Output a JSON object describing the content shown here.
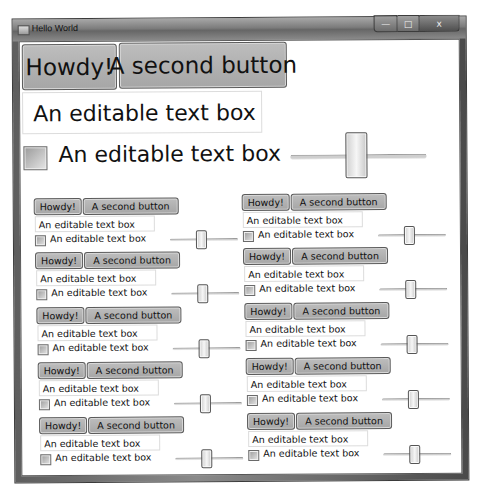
{
  "window": {
    "title": "Hello World",
    "caption_buttons": {
      "minimize": "—",
      "maximize": "□",
      "close": "x"
    }
  },
  "main_controls": {
    "button_1": "Howdy!",
    "button_2": "A second button",
    "text_box_value": "An editable text box",
    "checkbox_label": "An editable text box",
    "checkbox_checked": false,
    "slider_value_pct": 50
  },
  "grid": {
    "columns": 2,
    "rows": 5,
    "items": [
      {
        "button_1": "Howdy!",
        "button_2": "A second button",
        "text_box_value": "An editable text box",
        "checkbox_label": "An editable text box"
      },
      {
        "button_1": "Howdy!",
        "button_2": "A second button",
        "text_box_value": "An editable text box",
        "checkbox_label": "An editable text box"
      },
      {
        "button_1": "Howdy!",
        "button_2": "A second button",
        "text_box_value": "An editable text box",
        "checkbox_label": "An editable text box"
      },
      {
        "button_1": "Howdy!",
        "button_2": "A second button",
        "text_box_value": "An editable text box",
        "checkbox_label": "An editable text box"
      },
      {
        "button_1": "Howdy!",
        "button_2": "A second button",
        "text_box_value": "An editable text box",
        "checkbox_label": "An editable text box"
      },
      {
        "button_1": "Howdy!",
        "button_2": "A second button",
        "text_box_value": "An editable text box",
        "checkbox_label": "An editable text box"
      },
      {
        "button_1": "Howdy!",
        "button_2": "A second button",
        "text_box_value": "An editable text box",
        "checkbox_label": "An editable text box"
      },
      {
        "button_1": "Howdy!",
        "button_2": "A second button",
        "text_box_value": "An editable text box",
        "checkbox_label": "An editable text box"
      },
      {
        "button_1": "Howdy!",
        "button_2": "A second button",
        "text_box_value": "An editable text box",
        "checkbox_label": "An editable text box"
      },
      {
        "button_1": "Howdy!",
        "button_2": "A second button",
        "text_box_value": "An editable text box",
        "checkbox_label": "An editable text box"
      }
    ]
  },
  "colors": {
    "button_face": "#b0b0b0",
    "frame": "#6e6e6e",
    "client_bg": "#ffffff"
  }
}
